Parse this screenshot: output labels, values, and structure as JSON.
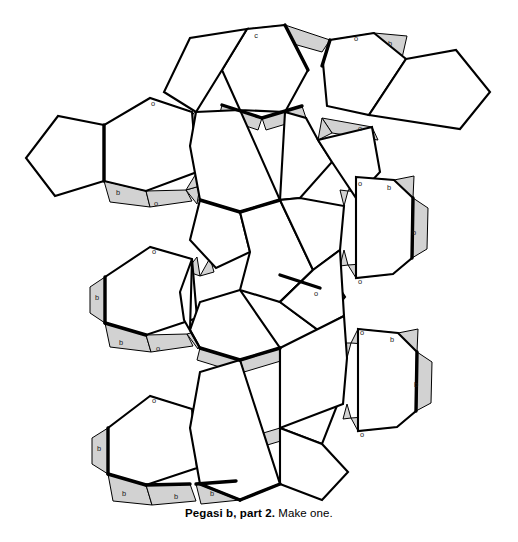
{
  "caption": {
    "title": "Pegasi b, part 2.",
    "rest": " Make one."
  },
  "figure": {
    "name": "papercraft-net-pegasi-b-part-2",
    "colors": {
      "stroke": "#000000",
      "face_fill": "#ffffff",
      "tab_fill": "#d2d2d2",
      "tab_stroke": "#000000",
      "label_color": "#1a1a1a",
      "background": "#ffffff"
    },
    "counts": {
      "hexagons": 12,
      "pentagons": 8,
      "tabs": 24
    }
  },
  "faces": {
    "hexagons": [
      {
        "id": "hex-top-center",
        "cx": 262,
        "cy": 72,
        "r": 50,
        "rot": 0
      },
      {
        "id": "hex-top-right",
        "cx": 348,
        "cy": 78,
        "r": 50,
        "rot": 0
      },
      {
        "id": "hex-left-upper",
        "cx": 130,
        "cy": 142,
        "r": 50,
        "rot": 0
      },
      {
        "id": "hex-center-upper",
        "cx": 222,
        "cy": 158,
        "r": 50,
        "rot": 0
      },
      {
        "id": "hex-center-mid",
        "cx": 286,
        "cy": 212,
        "r": 42,
        "rot": 0
      },
      {
        "id": "hex-right-mid",
        "cx": 386,
        "cy": 227,
        "r": 50,
        "rot": 0
      },
      {
        "id": "hex-left-mid",
        "cx": 148,
        "cy": 300,
        "r": 50,
        "rot": 0
      },
      {
        "id": "hex-center-low",
        "cx": 240,
        "cy": 315,
        "r": 50,
        "rot": 0
      },
      {
        "id": "hex-right-low",
        "cx": 391,
        "cy": 384,
        "r": 50,
        "rot": 0
      },
      {
        "id": "hex-left-low",
        "cx": 152,
        "cy": 450,
        "r": 50,
        "rot": 0
      },
      {
        "id": "hex-center-lowest",
        "cx": 243,
        "cy": 460,
        "r": 50,
        "rot": 0
      },
      {
        "id": "hex-center-core",
        "cx": 268,
        "cy": 270,
        "r": 45,
        "rot": 0
      }
    ],
    "pentagons": [
      {
        "id": "pent-top-left",
        "cx": 205,
        "cy": 72
      },
      {
        "id": "pent-far-right",
        "cx": 462,
        "cy": 86
      },
      {
        "id": "pent-far-left",
        "cx": 55,
        "cy": 150
      },
      {
        "id": "pent-mid-right",
        "cx": 332,
        "cy": 182
      },
      {
        "id": "pent-center",
        "cx": 222,
        "cy": 230
      },
      {
        "id": "pent-center-low",
        "cx": 300,
        "cy": 300
      },
      {
        "id": "pent-left-low",
        "cx": 200,
        "cy": 382
      },
      {
        "id": "pent-bottom-right",
        "cx": 315,
        "cy": 455
      }
    ]
  },
  "tabs": [
    {
      "id": "tab-top-c",
      "label": "c",
      "x": 256,
      "y": 36
    },
    {
      "id": "tab-top-right-o",
      "label": "o",
      "x": 356,
      "y": 39
    },
    {
      "id": "tab-top-right-b",
      "label": "b",
      "x": 390,
      "y": 44
    },
    {
      "id": "tab-left-upper-o",
      "label": "o",
      "x": 153,
      "y": 104
    },
    {
      "id": "tab-right-upper-o",
      "label": "o",
      "x": 360,
      "y": 129
    },
    {
      "id": "tab-left-upper-b",
      "label": "b",
      "x": 118,
      "y": 193
    },
    {
      "id": "tab-left-upper-o2",
      "label": "o",
      "x": 156,
      "y": 204
    },
    {
      "id": "tab-right-mid-o",
      "label": "o",
      "x": 360,
      "y": 184
    },
    {
      "id": "tab-right-mid-b",
      "label": "b",
      "x": 389,
      "y": 188
    },
    {
      "id": "tab-right-mid-b2",
      "label": "b",
      "x": 414,
      "y": 233
    },
    {
      "id": "tab-right-mid-o2",
      "label": "o",
      "x": 360,
      "y": 282
    },
    {
      "id": "tab-left-mid-o",
      "label": "o",
      "x": 154,
      "y": 252
    },
    {
      "id": "tab-left-mid-b",
      "label": "b",
      "x": 97,
      "y": 298
    },
    {
      "id": "tab-left-mid-b2",
      "label": "b",
      "x": 121,
      "y": 343
    },
    {
      "id": "tab-left-mid-o2",
      "label": "o",
      "x": 158,
      "y": 349
    },
    {
      "id": "tab-right-low-o",
      "label": "o",
      "x": 362,
      "y": 333
    },
    {
      "id": "tab-right-low-b",
      "label": "b",
      "x": 392,
      "y": 340
    },
    {
      "id": "tab-right-low-b2",
      "label": "b",
      "x": 416,
      "y": 385
    },
    {
      "id": "tab-right-low-o2",
      "label": "o",
      "x": 362,
      "y": 435
    },
    {
      "id": "tab-left-low-o",
      "label": "o",
      "x": 154,
      "y": 401
    },
    {
      "id": "tab-left-low-b",
      "label": "b",
      "x": 99,
      "y": 449
    },
    {
      "id": "tab-bottom-b1",
      "label": "b",
      "x": 124,
      "y": 494
    },
    {
      "id": "tab-bottom-b2",
      "label": "b",
      "x": 176,
      "y": 497
    },
    {
      "id": "tab-bottom-b3",
      "label": "b",
      "x": 212,
      "y": 494
    }
  ]
}
